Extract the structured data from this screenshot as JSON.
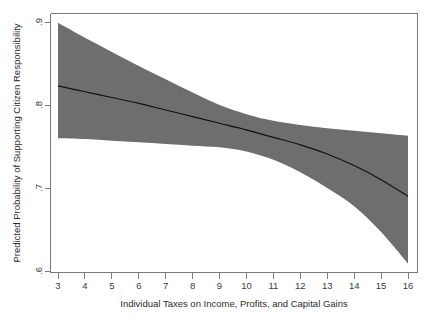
{
  "figure": {
    "background_color": "#ffffff",
    "width": 434,
    "height": 323
  },
  "chart_data": {
    "type": "line",
    "title": "",
    "subtitle": "",
    "xlabel": "Individual Taxes on Income, Profits, and Capital Gains",
    "ylabel": "Predicted Probability of Supporting Citizen Responsibility",
    "xlim": [
      3,
      16
    ],
    "ylim": [
      0.6,
      0.9
    ],
    "xticks": [
      3,
      4,
      5,
      6,
      7,
      8,
      9,
      10,
      11,
      12,
      13,
      14,
      15,
      16
    ],
    "xticklabels": [
      "3",
      "4",
      "5",
      "6",
      "7",
      "8",
      "9",
      "10",
      "11",
      "12",
      "13",
      "14",
      "15",
      "16"
    ],
    "yticks": [
      0.6,
      0.7,
      0.8,
      0.9
    ],
    "yticklabels": [
      ".6",
      ".7",
      ".8",
      ".9"
    ],
    "grid": false,
    "legend": false,
    "legend_position": "none",
    "x": [
      3,
      4,
      5,
      6,
      7,
      8,
      9,
      10,
      11,
      12,
      13,
      14,
      15,
      16
    ],
    "series": [
      {
        "name": "Predicted probability (fit)",
        "type": "line",
        "color": "#111111",
        "values": [
          0.823,
          0.816,
          0.809,
          0.802,
          0.794,
          0.786,
          0.778,
          0.77,
          0.761,
          0.752,
          0.741,
          0.727,
          0.71,
          0.69
        ]
      },
      {
        "name": "95% confidence interval (upper)",
        "type": "band-edge",
        "color": "#6e6e6e",
        "values": [
          0.899,
          0.881,
          0.864,
          0.847,
          0.831,
          0.815,
          0.8,
          0.789,
          0.781,
          0.776,
          0.772,
          0.769,
          0.766,
          0.763
        ]
      },
      {
        "name": "95% confidence interval (lower)",
        "type": "band-edge",
        "color": "#6e6e6e",
        "values": [
          0.76,
          0.759,
          0.757,
          0.755,
          0.753,
          0.751,
          0.749,
          0.744,
          0.734,
          0.719,
          0.7,
          0.678,
          0.647,
          0.609
        ]
      }
    ],
    "band_color": "#6e6e6e",
    "line_color": "#111111",
    "axis_color": "#7b7b7b"
  },
  "axes": {
    "x_title": "Individual Taxes on Income, Profits, and Capital Gains",
    "y_title": "Predicted Probability of Supporting Citizen Responsibility",
    "x_tick_labels": [
      "3",
      "4",
      "5",
      "6",
      "7",
      "8",
      "9",
      "10",
      "11",
      "12",
      "13",
      "14",
      "15",
      "16"
    ],
    "y_tick_labels": [
      ".9",
      ".8",
      ".7",
      ".6"
    ]
  }
}
